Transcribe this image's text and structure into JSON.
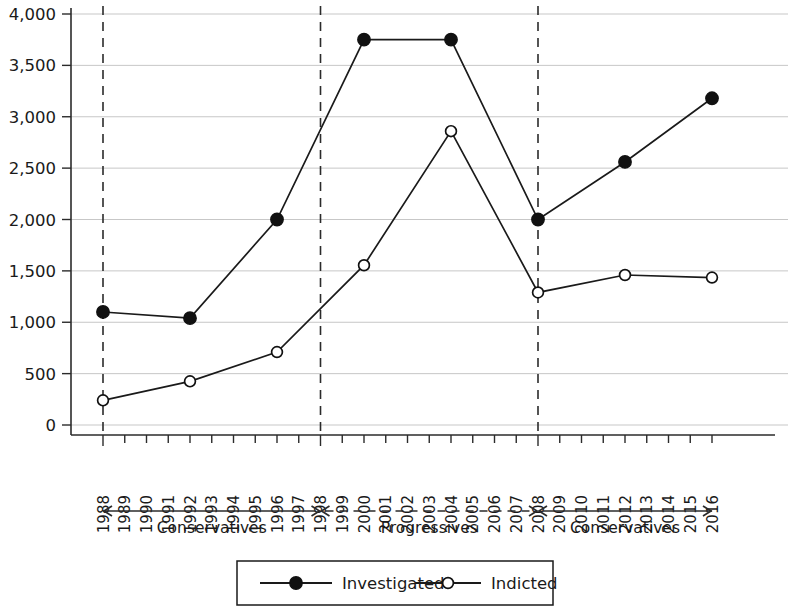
{
  "chart_data": {
    "type": "line",
    "title": "",
    "subtitle": "",
    "xlabel": "",
    "ylabel": "",
    "grid": true,
    "legend_position": "bottom",
    "ylim": [
      0,
      4000
    ],
    "ytick_labels": [
      "0",
      "500",
      "1,000",
      "1,500",
      "2,000",
      "2,500",
      "3,000",
      "3,500",
      "4,000"
    ],
    "ytick_values": [
      0,
      500,
      1000,
      1500,
      2000,
      2500,
      3000,
      3500,
      4000
    ],
    "x_tick_labels": [
      "1988",
      "1989",
      "1990",
      "1991",
      "1992",
      "1993",
      "1994",
      "1995",
      "1996",
      "1997",
      "1998",
      "1999",
      "2000",
      "2001",
      "2002",
      "2003",
      "2004",
      "2005",
      "2006",
      "2007",
      "2008",
      "2009",
      "2010",
      "2011",
      "2012",
      "2013",
      "2014",
      "2015",
      "2016"
    ],
    "xlim": [
      1988,
      2016
    ],
    "data_years": [
      1988,
      1992,
      1996,
      2000,
      2004,
      2008,
      2012,
      2016
    ],
    "series": [
      {
        "name": "Investigated",
        "marker": "filled-circle",
        "values": [
          1100,
          1040,
          2000,
          3750,
          3750,
          2000,
          2560,
          3180
        ]
      },
      {
        "name": "Indicted",
        "marker": "open-circle",
        "values": [
          240,
          425,
          710,
          1555,
          2860,
          1290,
          1460,
          1435
        ]
      }
    ],
    "annotations": {
      "dividers": [
        1988,
        1998,
        2008
      ],
      "periods": [
        {
          "label": "Conservatives",
          "start_year": 1988,
          "end_year": 1998,
          "line_style": "solid"
        },
        {
          "label": "Progressives",
          "start_year": 1998,
          "end_year": 2008,
          "line_style": "dashed"
        },
        {
          "label": "Conservatives",
          "start_year": 2008,
          "end_year": 2016,
          "line_style": "solid"
        }
      ]
    },
    "colors": {
      "line": "#1a1a1a",
      "grid": "#b9b9b9",
      "axis": "#2b2b2b",
      "marker_fill": "#111111",
      "marker_open_fill": "#ffffff"
    }
  }
}
